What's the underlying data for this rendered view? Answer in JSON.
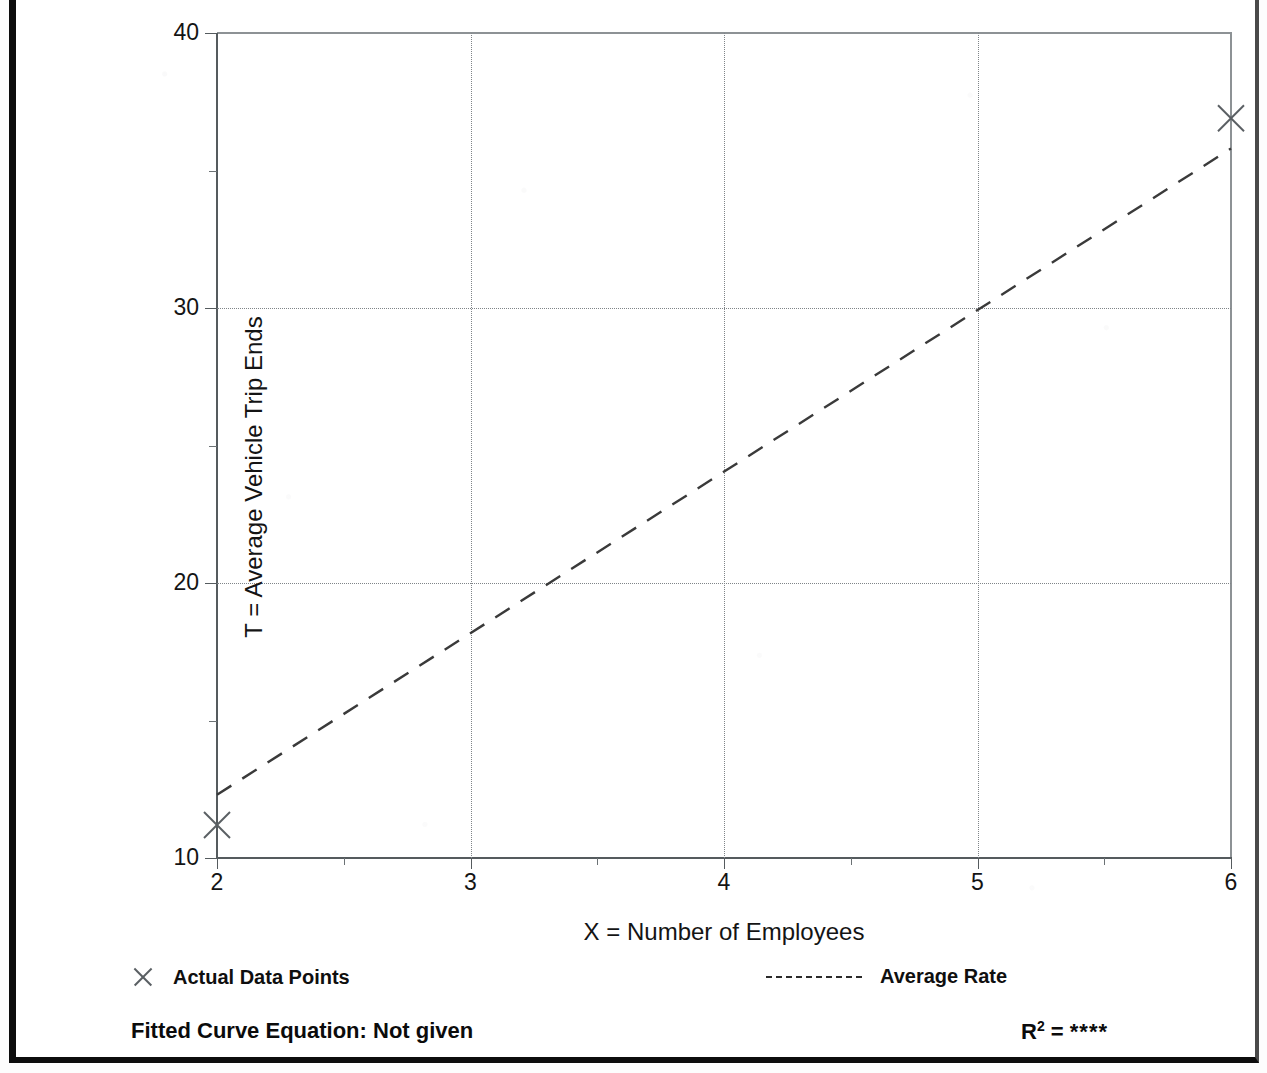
{
  "chart_data": {
    "type": "scatter",
    "title": "",
    "xlabel": "X = Number of Employees",
    "ylabel": "T = Average Vehicle Trip Ends",
    "xlim": [
      2,
      6
    ],
    "ylim": [
      10,
      40
    ],
    "x_ticks": [
      2,
      3,
      4,
      5,
      6
    ],
    "x_tick_labels": [
      "2",
      "3",
      "4",
      "5",
      "6"
    ],
    "x_minor_ticks": [
      2.5,
      3.5,
      4.5,
      5.5
    ],
    "y_ticks": [
      10,
      20,
      30,
      40
    ],
    "y_tick_labels": [
      "10",
      "20",
      "30",
      "40"
    ],
    "y_minor_ticks": [
      15,
      25,
      35
    ],
    "grid": true,
    "grid_style": "dotted",
    "grid_x_values": [
      3,
      4,
      5
    ],
    "grid_y_values": [
      20,
      30
    ],
    "legend_position": "below-axes",
    "series": [
      {
        "name": "Actual Data Points",
        "type": "scatter",
        "marker": "x",
        "points": [
          {
            "x": 2,
            "y": 11.2
          },
          {
            "x": 6,
            "y": 36.9
          }
        ]
      },
      {
        "name": "Average Rate",
        "type": "line",
        "linestyle": "dashed",
        "points": [
          {
            "x": 2,
            "y": 12.3
          },
          {
            "x": 6,
            "y": 35.8
          }
        ]
      }
    ]
  },
  "axes": {
    "y_title": "T = Average Vehicle Trip Ends",
    "x_title": "X = Number of Employees"
  },
  "legend": {
    "actual": {
      "label": "Actual Data Points",
      "marker": "x-marker-icon"
    },
    "average": {
      "label": "Average Rate",
      "marker": "dashed-line-icon"
    }
  },
  "footer": {
    "equation_label": "Fitted Curve Equation:  Not given",
    "r2_prefix": "R",
    "r2_exponent": "2",
    "r2_equals": " = ",
    "r2_value": "****"
  },
  "colors": {
    "axis": "#555b5e",
    "grid": "#7f8488",
    "series_line": "#3a3a3a",
    "marker": "#5a5f63",
    "text": "#0f0f0f",
    "frame": "#0d0d0d",
    "background": "#ffffff"
  }
}
